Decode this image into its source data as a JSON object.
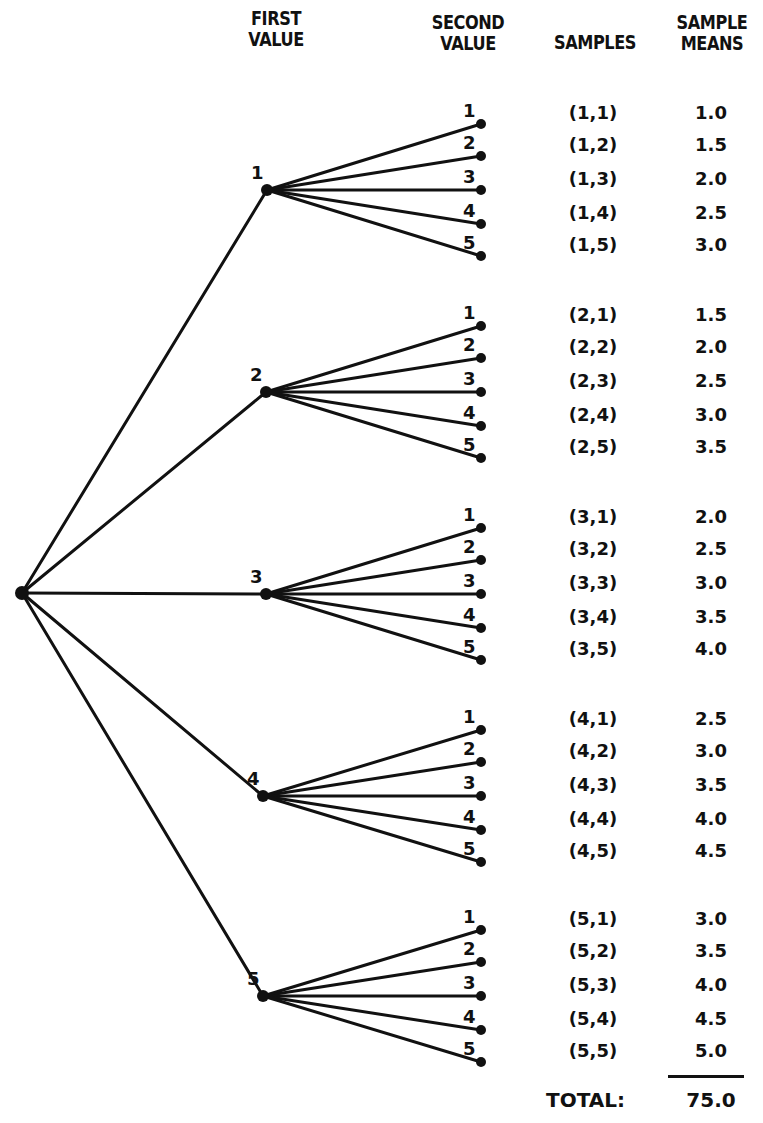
{
  "headers": {
    "first_value": [
      "FIRST",
      "VALUE"
    ],
    "second_value": [
      "SECOND",
      "VALUE"
    ],
    "samples": "SAMPLES",
    "sample_means": [
      "SAMPLE",
      "MEANS"
    ]
  },
  "first_values": [
    "1",
    "2",
    "3",
    "4",
    "5"
  ],
  "second_values": [
    "1",
    "2",
    "3",
    "4",
    "5"
  ],
  "branches": [
    {
      "first": "1",
      "samples": [
        "(1,1)",
        "(1,2)",
        "(1,3)",
        "(1,4)",
        "(1,5)"
      ],
      "means": [
        "1.0",
        "1.5",
        "2.0",
        "2.5",
        "3.0"
      ]
    },
    {
      "first": "2",
      "samples": [
        "(2,1)",
        "(2,2)",
        "(2,3)",
        "(2,4)",
        "(2,5)"
      ],
      "means": [
        "1.5",
        "2.0",
        "2.5",
        "3.0",
        "3.5"
      ]
    },
    {
      "first": "3",
      "samples": [
        "(3,1)",
        "(3,2)",
        "(3,3)",
        "(3,4)",
        "(3,5)"
      ],
      "means": [
        "2.0",
        "2.5",
        "3.0",
        "3.5",
        "4.0"
      ]
    },
    {
      "first": "4",
      "samples": [
        "(4,1)",
        "(4,2)",
        "(4,3)",
        "(4,4)",
        "(4,5)"
      ],
      "means": [
        "2.5",
        "3.0",
        "3.5",
        "4.0",
        "4.5"
      ]
    },
    {
      "first": "5",
      "samples": [
        "(5,1)",
        "(5,2)",
        "(5,3)",
        "(5,4)",
        "(5,5)"
      ],
      "means": [
        "3.0",
        "3.5",
        "4.0",
        "4.5",
        "5.0"
      ]
    }
  ],
  "total": {
    "label": "TOTAL:",
    "value": "75.0"
  },
  "colors": {
    "ink": "#111111",
    "background": "#ffffff"
  }
}
